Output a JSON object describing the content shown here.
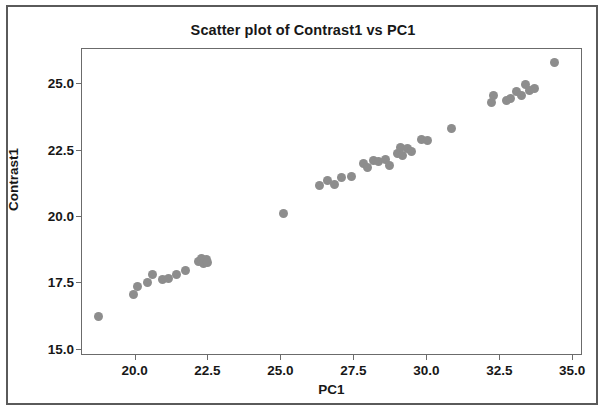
{
  "chart_data": {
    "type": "scatter",
    "title": "Scatter plot of Contrast1 vs PC1",
    "xlabel": "PC1",
    "ylabel": "Contrast1",
    "xlim": [
      18.2,
      35.3
    ],
    "ylim": [
      14.8,
      26.3
    ],
    "xticks": [
      "20.0",
      "22.5",
      "25.0",
      "27.5",
      "30.0",
      "32.5",
      "35.0"
    ],
    "xtick_values": [
      20.0,
      22.5,
      25.0,
      27.5,
      30.0,
      32.5,
      35.0
    ],
    "yticks": [
      "15.0",
      "17.5",
      "20.0",
      "22.5",
      "25.0"
    ],
    "ytick_values": [
      15.0,
      17.5,
      20.0,
      22.5,
      25.0
    ],
    "grid": false,
    "legend": false,
    "marker_color": "#8d8d8d",
    "marker_size": 9,
    "series": [
      {
        "name": "Contrast1 vs PC1",
        "points": [
          [
            18.75,
            16.2
          ],
          [
            19.95,
            17.05
          ],
          [
            20.1,
            17.35
          ],
          [
            20.45,
            17.5
          ],
          [
            20.6,
            17.8
          ],
          [
            20.95,
            17.6
          ],
          [
            21.15,
            17.65
          ],
          [
            21.45,
            17.8
          ],
          [
            21.75,
            17.95
          ],
          [
            22.2,
            18.3
          ],
          [
            22.3,
            18.4
          ],
          [
            22.35,
            18.2
          ],
          [
            22.45,
            18.35
          ],
          [
            22.5,
            18.25
          ],
          [
            25.1,
            20.1
          ],
          [
            26.35,
            21.15
          ],
          [
            26.6,
            21.35
          ],
          [
            26.85,
            21.2
          ],
          [
            27.1,
            21.45
          ],
          [
            27.45,
            21.5
          ],
          [
            27.85,
            22.0
          ],
          [
            28.0,
            21.85
          ],
          [
            28.2,
            22.1
          ],
          [
            28.35,
            22.05
          ],
          [
            28.6,
            22.15
          ],
          [
            28.75,
            21.9
          ],
          [
            29.0,
            22.35
          ],
          [
            29.1,
            22.6
          ],
          [
            29.2,
            22.3
          ],
          [
            29.35,
            22.55
          ],
          [
            29.5,
            22.45
          ],
          [
            29.85,
            22.9
          ],
          [
            30.05,
            22.85
          ],
          [
            30.85,
            23.3
          ],
          [
            32.25,
            24.3
          ],
          [
            32.3,
            24.55
          ],
          [
            32.75,
            24.35
          ],
          [
            32.9,
            24.45
          ],
          [
            33.1,
            24.7
          ],
          [
            33.25,
            24.55
          ],
          [
            33.4,
            24.95
          ],
          [
            33.55,
            24.75
          ],
          [
            33.7,
            24.8
          ],
          [
            34.4,
            25.8
          ]
        ]
      }
    ]
  }
}
